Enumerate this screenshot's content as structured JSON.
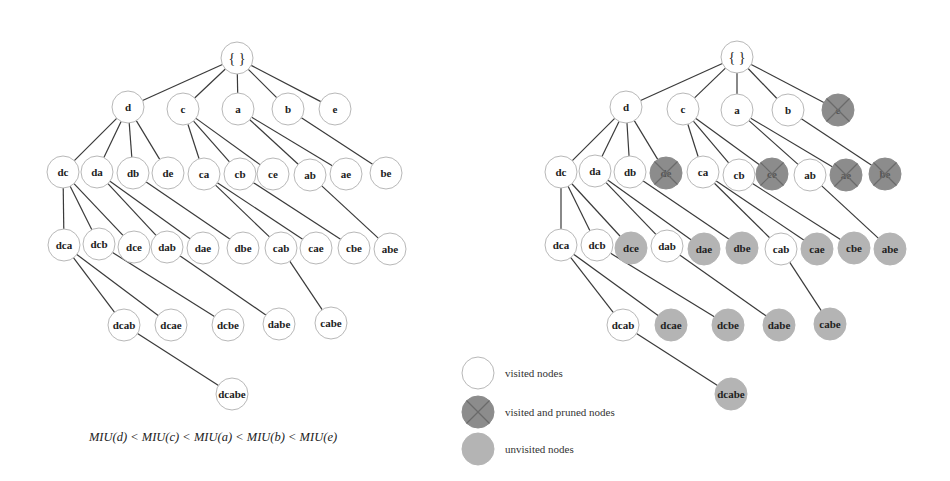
{
  "trees": [
    {
      "id": "left-tree",
      "nodes": [
        {
          "id": "root",
          "label": "{ }",
          "x": 237,
          "y": 58,
          "state": "visited"
        },
        {
          "id": "d",
          "label": "d",
          "x": 128,
          "y": 107,
          "state": "visited"
        },
        {
          "id": "c",
          "label": "c",
          "x": 183,
          "y": 109,
          "state": "visited"
        },
        {
          "id": "a",
          "label": "a",
          "x": 238,
          "y": 109,
          "state": "visited"
        },
        {
          "id": "b",
          "label": "b",
          "x": 288,
          "y": 109,
          "state": "visited"
        },
        {
          "id": "e",
          "label": "e",
          "x": 335,
          "y": 109,
          "state": "visited"
        },
        {
          "id": "dc",
          "label": "dc",
          "x": 63,
          "y": 172,
          "state": "visited"
        },
        {
          "id": "da",
          "label": "da",
          "x": 97,
          "y": 172,
          "state": "visited"
        },
        {
          "id": "db",
          "label": "db",
          "x": 133,
          "y": 173,
          "state": "visited"
        },
        {
          "id": "de",
          "label": "de",
          "x": 168,
          "y": 173,
          "state": "visited"
        },
        {
          "id": "ca",
          "label": "ca",
          "x": 204,
          "y": 174,
          "state": "visited"
        },
        {
          "id": "cb",
          "label": "cb",
          "x": 240,
          "y": 174,
          "state": "visited"
        },
        {
          "id": "ce",
          "label": "ce",
          "x": 273,
          "y": 174,
          "state": "visited"
        },
        {
          "id": "ab",
          "label": "ab",
          "x": 310,
          "y": 175,
          "state": "visited"
        },
        {
          "id": "ae",
          "label": "ae",
          "x": 346,
          "y": 174,
          "state": "visited"
        },
        {
          "id": "be",
          "label": "be",
          "x": 386,
          "y": 173,
          "state": "visited"
        },
        {
          "id": "dca",
          "label": "dca",
          "x": 64,
          "y": 245,
          "state": "visited"
        },
        {
          "id": "dcb",
          "label": "dcb",
          "x": 99,
          "y": 244,
          "state": "visited"
        },
        {
          "id": "dce",
          "label": "dce",
          "x": 134,
          "y": 247,
          "state": "visited"
        },
        {
          "id": "dab",
          "label": "dab",
          "x": 167,
          "y": 247,
          "state": "visited"
        },
        {
          "id": "dae",
          "label": "dae",
          "x": 203,
          "y": 248,
          "state": "visited"
        },
        {
          "id": "dbe",
          "label": "dbe",
          "x": 243,
          "y": 248,
          "state": "visited"
        },
        {
          "id": "cab",
          "label": "cab",
          "x": 281,
          "y": 248,
          "state": "visited"
        },
        {
          "id": "cae",
          "label": "cae",
          "x": 316,
          "y": 248,
          "state": "visited"
        },
        {
          "id": "cbe",
          "label": "cbe",
          "x": 354,
          "y": 248,
          "state": "visited"
        },
        {
          "id": "abe",
          "label": "abe",
          "x": 390,
          "y": 249,
          "state": "visited"
        },
        {
          "id": "dcab",
          "label": "dcab",
          "x": 124,
          "y": 325,
          "state": "visited"
        },
        {
          "id": "dcae",
          "label": "dcae",
          "x": 171,
          "y": 325,
          "state": "visited"
        },
        {
          "id": "dcbe",
          "label": "dcbe",
          "x": 228,
          "y": 325,
          "state": "visited"
        },
        {
          "id": "dabe",
          "label": "dabe",
          "x": 279,
          "y": 324,
          "state": "visited"
        },
        {
          "id": "cabe",
          "label": "cabe",
          "x": 331,
          "y": 323,
          "state": "visited"
        },
        {
          "id": "dcabe",
          "label": "dcabe",
          "x": 232,
          "y": 394,
          "state": "visited"
        }
      ]
    },
    {
      "id": "right-tree",
      "nodes": [
        {
          "id": "root",
          "label": "{ }",
          "x": 737,
          "y": 57,
          "state": "visited"
        },
        {
          "id": "d",
          "label": "d",
          "x": 626,
          "y": 107,
          "state": "visited"
        },
        {
          "id": "c",
          "label": "c",
          "x": 683,
          "y": 109,
          "state": "visited"
        },
        {
          "id": "a",
          "label": "a",
          "x": 737,
          "y": 110,
          "state": "visited"
        },
        {
          "id": "b",
          "label": "b",
          "x": 788,
          "y": 110,
          "state": "visited"
        },
        {
          "id": "e",
          "label": "e",
          "x": 838,
          "y": 110,
          "state": "pruned"
        },
        {
          "id": "dc",
          "label": "dc",
          "x": 561,
          "y": 172,
          "state": "visited"
        },
        {
          "id": "da",
          "label": "da",
          "x": 595,
          "y": 171,
          "state": "visited"
        },
        {
          "id": "db",
          "label": "db",
          "x": 630,
          "y": 172,
          "state": "visited"
        },
        {
          "id": "de",
          "label": "de",
          "x": 666,
          "y": 173,
          "state": "pruned"
        },
        {
          "id": "ca",
          "label": "ca",
          "x": 703,
          "y": 172,
          "state": "visited"
        },
        {
          "id": "cb",
          "label": "cb",
          "x": 739,
          "y": 175,
          "state": "visited"
        },
        {
          "id": "ce",
          "label": "ce",
          "x": 772,
          "y": 174,
          "state": "pruned"
        },
        {
          "id": "ab",
          "label": "ab",
          "x": 810,
          "y": 175,
          "state": "visited"
        },
        {
          "id": "ae",
          "label": "ae",
          "x": 846,
          "y": 175,
          "state": "pruned"
        },
        {
          "id": "be",
          "label": "be",
          "x": 885,
          "y": 174,
          "state": "pruned"
        },
        {
          "id": "dca",
          "label": "dca",
          "x": 561,
          "y": 245,
          "state": "visited"
        },
        {
          "id": "dcb",
          "label": "dcb",
          "x": 597,
          "y": 245,
          "state": "visited"
        },
        {
          "id": "dce",
          "label": "dce",
          "x": 631,
          "y": 248,
          "state": "unvisited"
        },
        {
          "id": "dab",
          "label": "dab",
          "x": 667,
          "y": 246,
          "state": "visited"
        },
        {
          "id": "dae",
          "label": "dae",
          "x": 704,
          "y": 249,
          "state": "unvisited"
        },
        {
          "id": "dbe",
          "label": "dbe",
          "x": 742,
          "y": 248,
          "state": "unvisited"
        },
        {
          "id": "cab",
          "label": "cab",
          "x": 781,
          "y": 249,
          "state": "visited"
        },
        {
          "id": "cae",
          "label": "cae",
          "x": 817,
          "y": 249,
          "state": "unvisited"
        },
        {
          "id": "cbe",
          "label": "cbe",
          "x": 854,
          "y": 248,
          "state": "unvisited"
        },
        {
          "id": "abe",
          "label": "abe",
          "x": 890,
          "y": 249,
          "state": "unvisited"
        },
        {
          "id": "dcab",
          "label": "dcab",
          "x": 623,
          "y": 325,
          "state": "visited"
        },
        {
          "id": "dcae",
          "label": "dcae",
          "x": 671,
          "y": 325,
          "state": "unvisited"
        },
        {
          "id": "dcbe",
          "label": "dcbe",
          "x": 728,
          "y": 325,
          "state": "unvisited"
        },
        {
          "id": "dabe",
          "label": "dabe",
          "x": 779,
          "y": 325,
          "state": "unvisited"
        },
        {
          "id": "cabe",
          "label": "cabe",
          "x": 830,
          "y": 324,
          "state": "unvisited"
        },
        {
          "id": "dcabe",
          "label": "dcabe",
          "x": 731,
          "y": 394,
          "state": "unvisited"
        }
      ]
    }
  ],
  "edges": [
    [
      "root",
      "d"
    ],
    [
      "root",
      "c"
    ],
    [
      "root",
      "a"
    ],
    [
      "root",
      "b"
    ],
    [
      "root",
      "e"
    ],
    [
      "d",
      "dc"
    ],
    [
      "d",
      "da"
    ],
    [
      "d",
      "db"
    ],
    [
      "d",
      "de"
    ],
    [
      "c",
      "ca"
    ],
    [
      "c",
      "cb"
    ],
    [
      "c",
      "ce"
    ],
    [
      "a",
      "ab"
    ],
    [
      "a",
      "ae"
    ],
    [
      "b",
      "be"
    ],
    [
      "dc",
      "dca"
    ],
    [
      "dc",
      "dcb"
    ],
    [
      "dc",
      "dce"
    ],
    [
      "da",
      "dab"
    ],
    [
      "da",
      "dae"
    ],
    [
      "db",
      "dbe"
    ],
    [
      "ca",
      "cab"
    ],
    [
      "ca",
      "cae"
    ],
    [
      "cb",
      "cbe"
    ],
    [
      "ab",
      "abe"
    ],
    [
      "dca",
      "dcab"
    ],
    [
      "dca",
      "dcae"
    ],
    [
      "dcb",
      "dcbe"
    ],
    [
      "dab",
      "dabe"
    ],
    [
      "cab",
      "cabe"
    ],
    [
      "dcab",
      "dcabe"
    ]
  ],
  "node_radius": 16,
  "formula": {
    "text": "MIU(d) < MIU(c) < MIU(a) < MIU(b) < MIU(e)",
    "x": 213,
    "y": 437
  },
  "legend": {
    "items": [
      {
        "state": "visited",
        "label": "visited nodes",
        "x": 478,
        "y": 373
      },
      {
        "state": "pruned",
        "label": "visited and pruned nodes",
        "x": 478,
        "y": 412
      },
      {
        "state": "unvisited",
        "label": "unvisited nodes",
        "x": 478,
        "y": 449
      }
    ]
  },
  "colors": {
    "visited_fill": "#ffffff",
    "pruned_fill": "#8c8c8c",
    "unvisited_fill": "#b4b4b4",
    "edge": "#3a3a3a"
  }
}
